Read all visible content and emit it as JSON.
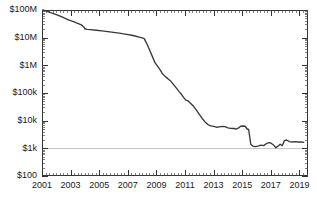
{
  "chart_data": {
    "type": "line",
    "title": "",
    "subtitle": "",
    "xlabel": "",
    "ylabel": "",
    "yscale": "log",
    "ylim": [
      100,
      100000000
    ],
    "xlim": [
      2001.0,
      2019.6
    ],
    "grid": "horizontal-at-1k-only",
    "legend": "none",
    "y_tick_labels": [
      "$100M",
      "$10M",
      "$1M",
      "$100k",
      "$10k",
      "$1k",
      "$100"
    ],
    "y_tick_values": [
      100000000,
      10000000,
      1000000,
      100000,
      10000,
      1000,
      100
    ],
    "x_tick_labels": [
      "2001",
      "2003",
      "2005",
      "2007",
      "2009",
      "2011",
      "2013",
      "2015",
      "2017",
      "2019"
    ],
    "x_tick_values": [
      2001,
      2003,
      2005,
      2007,
      2009,
      2011,
      2013,
      2015,
      2017,
      2019
    ],
    "x_minor_interval": 0.25,
    "series": [
      {
        "name": "value",
        "color": "#3a3a3a",
        "x": [
          2001.05,
          2001.3,
          2001.6,
          2002.0,
          2002.4,
          2002.8,
          2003.2,
          2003.5,
          2003.75,
          2003.9,
          2004.0,
          2004.15,
          2004.4,
          2004.8,
          2005.2,
          2005.6,
          2006.0,
          2006.4,
          2006.8,
          2007.2,
          2007.5,
          2007.8,
          2008.0,
          2008.15,
          2008.3,
          2008.5,
          2008.7,
          2008.9,
          2009.1,
          2009.25,
          2009.4,
          2009.6,
          2009.8,
          2010.0,
          2010.2,
          2010.4,
          2010.6,
          2010.75,
          2010.9,
          2011.05,
          2011.2,
          2011.4,
          2011.6,
          2011.8,
          2012.0,
          2012.2,
          2012.4,
          2012.6,
          2012.8,
          2013.0,
          2013.2,
          2013.4,
          2013.6,
          2013.8,
          2014.0,
          2014.2,
          2014.4,
          2014.6,
          2014.75,
          2014.9,
          2015.0,
          2015.2,
          2015.35,
          2015.45,
          2015.6,
          2015.75,
          2015.9,
          2016.1,
          2016.3,
          2016.5,
          2016.7,
          2016.9,
          2017.05,
          2017.2,
          2017.35,
          2017.5,
          2017.65,
          2017.8,
          2017.95,
          2018.1,
          2018.3,
          2018.5,
          2018.7,
          2018.9,
          2019.1,
          2019.3
        ],
        "y": [
          100000000,
          92000000,
          80000000,
          68000000,
          56000000,
          45000000,
          38000000,
          33000000,
          29000000,
          25000000,
          21000000,
          20000000,
          19500000,
          18500000,
          17500000,
          16500000,
          15500000,
          14500000,
          13500000,
          12500000,
          11500000,
          10500000,
          9800000,
          9200000,
          6500000,
          3800000,
          2200000,
          1250000,
          900000,
          700000,
          520000,
          400000,
          330000,
          270000,
          200000,
          150000,
          110000,
          90000,
          70000,
          55000,
          52000,
          42000,
          33000,
          24000,
          17000,
          12000,
          9000,
          7200,
          6500,
          6200,
          5800,
          6000,
          6200,
          6100,
          5500,
          5300,
          5200,
          5000,
          5500,
          6300,
          6400,
          6300,
          5000,
          4800,
          1400,
          1200,
          1150,
          1200,
          1300,
          1250,
          1500,
          1600,
          1500,
          1300,
          1050,
          1200,
          1400,
          1250,
          1900,
          2000,
          1750,
          1700,
          1750,
          1700,
          1700,
          1650
        ]
      }
    ]
  },
  "plot": {
    "left_px": 42,
    "right_px": 308,
    "top_px": 10,
    "bottom_px": 176,
    "gridline_at": 1000
  }
}
